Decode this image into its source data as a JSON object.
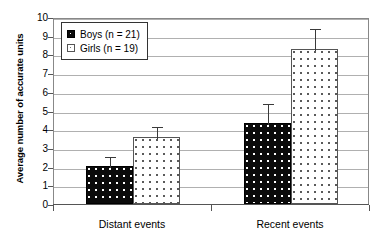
{
  "chart_data": {
    "type": "bar",
    "title": "",
    "subtitle": "",
    "xlabel": "",
    "ylabel": "Average number of accurate units",
    "categories": [
      "Distant events",
      "Recent events"
    ],
    "ylim": [
      0,
      10
    ],
    "y_ticks": [
      0,
      1,
      2,
      3,
      4,
      5,
      6,
      7,
      8,
      9,
      10
    ],
    "y_tick_labels": [
      "0",
      "1",
      "2",
      "3",
      "4",
      "5",
      "6",
      "7",
      "8",
      "9",
      "10"
    ],
    "grid": true,
    "grid_axis": "y",
    "legend_position": "upper left",
    "error_bars": "upper only",
    "series": [
      {
        "name": "Boys (n = 21)",
        "short_name": "Boys",
        "n": 21,
        "fill": "black-dotted",
        "color": "#0b0b0b",
        "values": [
          2.05,
          4.35
        ],
        "errors_upper": [
          0.55,
          1.1
        ],
        "error_tops": [
          2.6,
          5.45
        ]
      },
      {
        "name": "Girls (n = 19)",
        "short_name": "Girls",
        "n": 19,
        "fill": "white-dotted",
        "color": "#ffffff",
        "values": [
          3.6,
          8.3
        ],
        "errors_upper": [
          0.65,
          1.15
        ],
        "error_tops": [
          4.25,
          9.45
        ]
      }
    ],
    "annotations": []
  },
  "legend": {
    "entries": [
      {
        "label": "Boys (n = 21)",
        "swatch": "black-dotted-swatch"
      },
      {
        "label": "Girls (n = 19)",
        "swatch": "white-dotted-swatch"
      }
    ]
  },
  "axes": {
    "y_title": "Average number of accurate units",
    "y_tick_labels": [
      "10",
      "9",
      "8",
      "7",
      "6",
      "5",
      "4",
      "3",
      "2",
      "1",
      "0"
    ],
    "x_tick_labels": [
      "Distant events",
      "Recent events"
    ]
  },
  "colors": {
    "bar_boys": "#0b0b0b",
    "bar_girls": "#ffffff",
    "gridline": "#b0b0b0",
    "axis": "#555555",
    "error_bar": "#3a3a3a",
    "text": "#000000",
    "background": "#ffffff"
  }
}
